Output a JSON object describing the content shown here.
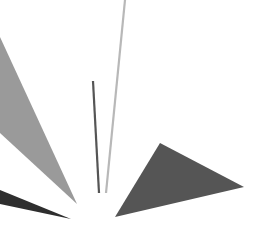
{
  "canvas": {
    "width": 261,
    "height": 241,
    "background": "#ffffff"
  },
  "shapes": [
    {
      "name": "gray-triangle-left",
      "type": "polygon",
      "points": "0,37 0,133 77,204",
      "fill": "#9a9a9a"
    },
    {
      "name": "dark-sliver-bottom-left",
      "type": "polygon",
      "points": "0,190 0,204 71,219",
      "fill": "#2e2e2e"
    },
    {
      "name": "dark-triangle-right",
      "type": "polygon",
      "points": "160,143 244,187 115,217",
      "fill": "#555555"
    },
    {
      "name": "dark-line",
      "type": "line",
      "x1": 93,
      "y1": 81,
      "x2": 99,
      "y2": 193,
      "stroke": "#555555",
      "width": 2.2
    },
    {
      "name": "light-line",
      "type": "line",
      "x1": 125,
      "y1": 0,
      "x2": 106,
      "y2": 193,
      "stroke": "#b8b8b8",
      "width": 2.2
    }
  ]
}
